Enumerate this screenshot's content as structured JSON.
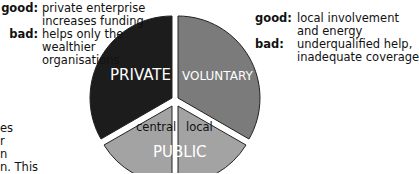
{
  "left_note": {
    "good_key": "good:",
    "good_lines": [
      "private enterprise",
      "increases funding"
    ],
    "bad_key": "bad:",
    "bad_lines": [
      "helps only the",
      "wealthier",
      "organisations"
    ]
  },
  "right_note": {
    "good_key": "good:",
    "good_lines": [
      "local involvement",
      "and energy"
    ],
    "bad_key": "bad:",
    "bad_lines": [
      "underqualified help,",
      "inadequate coverage"
    ]
  },
  "pie": {
    "sectors": [
      {
        "label": "PRIVATE",
        "color": "#1c1c1c",
        "text_color": "#ffffff"
      },
      {
        "label": "VOLUNTARY",
        "color": "#7b7b7b",
        "text_color": "#ffffff"
      },
      {
        "label": "PUBLIC",
        "color": "#a3a3a3",
        "text_color": "#ffffff",
        "subsectors": [
          {
            "label": "central"
          },
          {
            "label": "local"
          }
        ]
      }
    ],
    "gap_color": "#ffffff",
    "outline_color": "#222222"
  },
  "left_fragments": [
    "es",
    "r",
    "n",
    "n. This"
  ]
}
